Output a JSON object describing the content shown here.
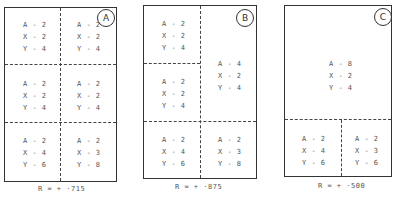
{
  "panels": [
    {
      "id": "A",
      "r_label": "R = + ·715",
      "cells": [
        {
          "a": "A - 2",
          "x": "X - 2",
          "y": "Y - 4"
        },
        {
          "a": "A - 2",
          "x": "X - 2",
          "y": "Y - 4"
        },
        {
          "a": "A - 2",
          "x": "X - 2",
          "y": "Y - 4"
        },
        {
          "a": "A - 2",
          "x": "X - 2",
          "y": "Y - 4"
        },
        {
          "a": "A - 2",
          "x": "X - 4",
          "y": "Y - 6"
        },
        {
          "a": "A - 2",
          "x": "X - 3",
          "y": "Y - 8"
        }
      ]
    },
    {
      "id": "B",
      "r_label": "R = + ·875",
      "cells": [
        {
          "a": "A - 2",
          "x": "X - 2",
          "y": "Y - 4"
        },
        {
          "a": "A - 2",
          "x": "X - 2",
          "y": "Y - 4"
        },
        {
          "a": "A - 4",
          "x": "X - 2",
          "y": "Y - 4"
        },
        {
          "a": "A - 2",
          "x": "X - 4",
          "y": "Y - 6"
        },
        {
          "a": "A - 2",
          "x": "X - 3",
          "y": "Y - 8"
        }
      ]
    },
    {
      "id": "C",
      "r_label": "R = + ·500",
      "cells": [
        {
          "a": "A - 8",
          "x": "X - 2",
          "y": "Y - 4"
        },
        {
          "a": "A - 2",
          "x": "X - 4",
          "y": "Y - 6"
        },
        {
          "a": "A - 2",
          "x": "X - 3",
          "y": "Y - 6"
        }
      ]
    }
  ]
}
